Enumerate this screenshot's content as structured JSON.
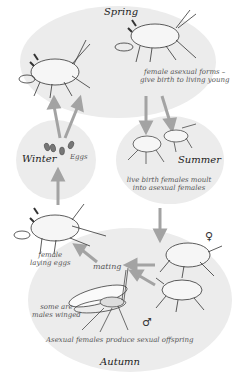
{
  "diagram": {
    "colors": {
      "background": "#ffffff",
      "ellipse_fill": "#ececec",
      "arrow": "#a3a3a3",
      "ink": "#333333"
    },
    "seasons": {
      "spring": "Spring",
      "summer": "Summer",
      "autumn": "Autumn",
      "winter": "Winter"
    },
    "labels": {
      "spring_note_line1": "female asexual forms –",
      "spring_note_line2": "give birth to living young",
      "winter_eggs": "Eggs",
      "summer_note_line1": "live birth females moult",
      "summer_note_line2": "into asexual females",
      "female_laying_line1": "female",
      "female_laying_line2": "laying eggs",
      "mating": "mating",
      "winged_line1": "some are",
      "winged_line2": "males winged",
      "autumn_note": "Asexual females produce sexual offspring",
      "female_symbol": "♀",
      "male_symbol": "♂"
    },
    "icons": [
      "aphid-adult",
      "aphid-nymph",
      "winged-male-aphid",
      "egg",
      "arrow"
    ]
  }
}
